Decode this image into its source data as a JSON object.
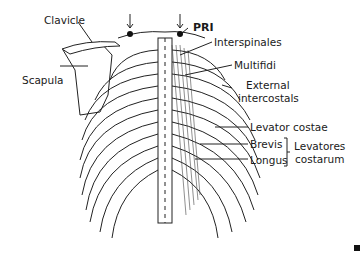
{
  "diagram": {
    "labels": {
      "clavicle": "Clavicle",
      "scapula": "Scapula",
      "pri": "PRI",
      "interspinales": "Interspinales",
      "multifidi": "Multifidi",
      "external_intercostals_1": "External",
      "external_intercostals_2": "intercostals",
      "levator_costae": "Levator costae",
      "brevis": "Brevis",
      "longus": "Longus",
      "levatores_costarum_1": "Levatores",
      "levatores_costarum_2": "costarum"
    },
    "colors": {
      "line": "#1a1a1a",
      "background": "#ffffff"
    }
  }
}
